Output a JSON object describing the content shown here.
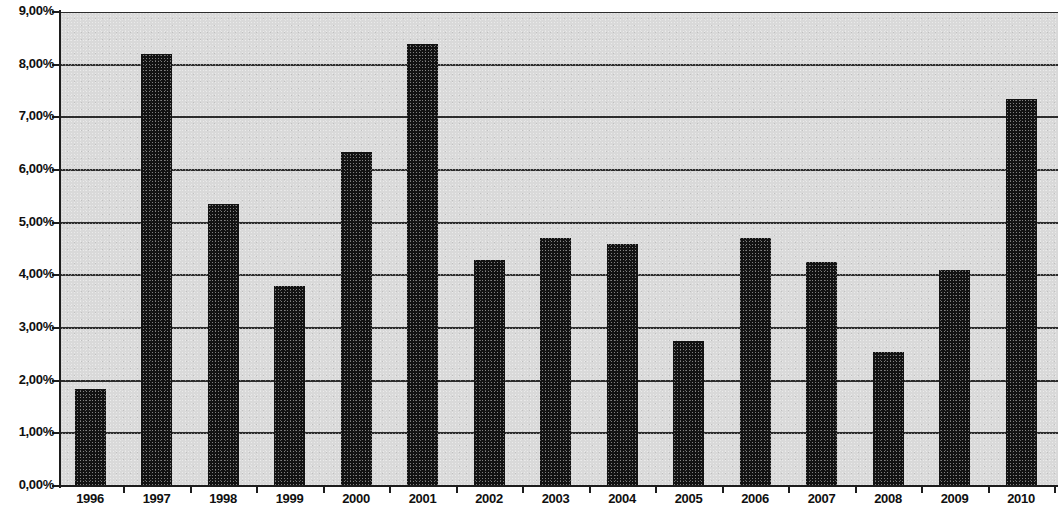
{
  "chart_data": {
    "type": "bar",
    "title": "",
    "subtitle": "",
    "xlabel": "",
    "ylabel": "",
    "categories": [
      "1996",
      "1997",
      "1998",
      "1999",
      "2000",
      "2001",
      "2002",
      "2003",
      "2004",
      "2005",
      "2006",
      "2007",
      "2008",
      "2009",
      "2010"
    ],
    "values": [
      1.85,
      8.2,
      5.35,
      3.8,
      6.35,
      8.4,
      4.3,
      4.7,
      4.6,
      2.75,
      4.7,
      4.25,
      2.55,
      4.1,
      7.35
    ],
    "value_unit": "%",
    "ylim": [
      0,
      9
    ],
    "ytick_labels": [
      "0,00%",
      "1,00%",
      "2,00%",
      "3,00%",
      "4,00%",
      "5,00%",
      "6,00%",
      "7,00%",
      "8,00%",
      "9,00%"
    ],
    "ytick_values": [
      0,
      1,
      2,
      3,
      4,
      5,
      6,
      7,
      8,
      9
    ],
    "grid": true,
    "grid_axis": "y",
    "legend": false,
    "legend_position": "none",
    "bar_color": "#121212",
    "plot_background_color": "#d9d9d9",
    "axis_color": "#1d1d1d",
    "gridline_color": "#2c2c2c",
    "decimal_separator": ",",
    "series": [
      {
        "name": "",
        "values": [
          1.85,
          8.2,
          5.35,
          3.8,
          6.35,
          8.4,
          4.3,
          4.7,
          4.6,
          2.75,
          4.7,
          4.25,
          2.55,
          4.1,
          7.35
        ]
      }
    ]
  }
}
